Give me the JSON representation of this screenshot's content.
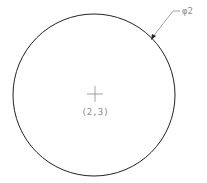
{
  "drawing": {
    "circle": {
      "cx": 94,
      "cy": 95,
      "r": 81,
      "stroke": "#222222"
    },
    "center_mark": {
      "x": 95,
      "y": 94,
      "size": 8,
      "stroke": "#8a8a8a"
    },
    "center_label": "(2,3)",
    "diameter_label": "φ2",
    "leader": {
      "arrow_x": 152,
      "arrow_y": 38,
      "elbow_x": 173,
      "elbow_y": 11,
      "end_x": 180,
      "end_y": 11,
      "stroke": "#8a8a8a"
    }
  }
}
